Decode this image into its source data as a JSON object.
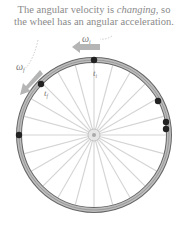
{
  "caption": {
    "line1_pre": "The angular velocity is ",
    "line1_em": "changing",
    "line1_post": ", so",
    "line2": "the wheel has an angular acceleration."
  },
  "labels": {
    "omega_i": "ω",
    "omega_i_sub": "i",
    "omega_f": "ω",
    "omega_f_sub": "f",
    "t_i": "t",
    "t_i_sub": "i",
    "t_f": "t",
    "t_f_sub": "f"
  },
  "colors": {
    "rim": "#9a9a9a",
    "rim_dark": "#555555",
    "spoke": "#cfcfcf",
    "dot": "#222222",
    "arrow": "#b0b0b0",
    "text": "#8a8a8a"
  }
}
